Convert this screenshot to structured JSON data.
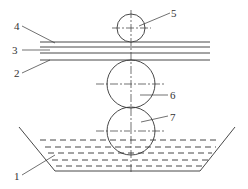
{
  "diagram": {
    "type": "roll coating apparatus schematic",
    "labels": [
      {
        "id": "1",
        "text": "1",
        "x": 15,
        "y": 171
      },
      {
        "id": "2",
        "text": "2",
        "x": 14,
        "y": 68
      },
      {
        "id": "3",
        "text": "3",
        "x": 14,
        "y": 46
      },
      {
        "id": "4",
        "text": "4",
        "x": 14,
        "y": 22
      },
      {
        "id": "5",
        "text": "5",
        "x": 171,
        "y": 9
      },
      {
        "id": "6",
        "text": "6",
        "x": 171,
        "y": 90
      },
      {
        "id": "7",
        "text": "7",
        "x": 171,
        "y": 112
      }
    ],
    "components": {
      "tank": "1",
      "strip_lower": "2",
      "strip_middle": "3",
      "strip_upper": "4",
      "top_roller": "5",
      "middle_roller": "6",
      "bottom_roller": "7"
    },
    "line_color": "#333333"
  }
}
